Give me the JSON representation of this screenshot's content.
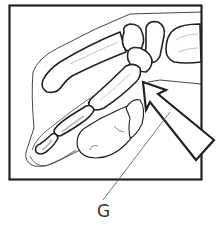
{
  "figure": {
    "labels": [
      {
        "id": "G",
        "text": "G"
      }
    ],
    "colors": {
      "line": "#222222",
      "thin_line": "#555555",
      "shade": "#bdbdbd",
      "background": "#ffffff"
    },
    "icons": [
      "arrow-pointer-icon"
    ]
  }
}
